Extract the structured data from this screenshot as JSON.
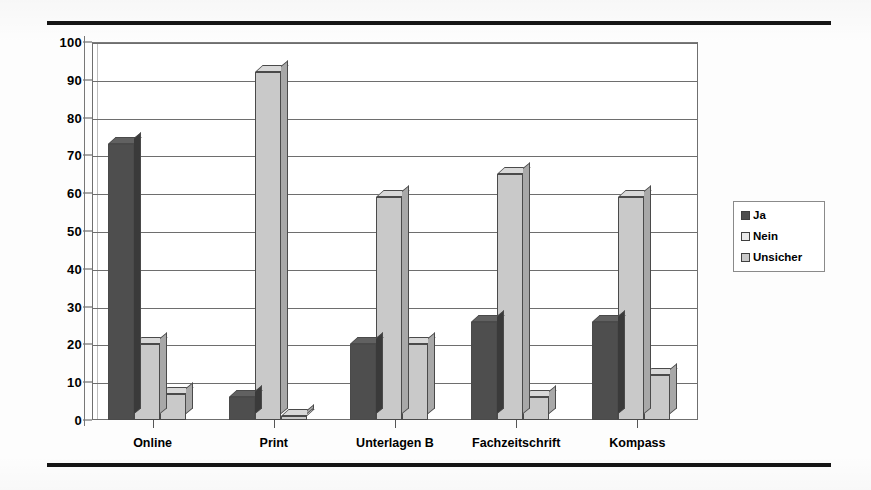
{
  "chart_data": {
    "type": "bar",
    "title": "",
    "xlabel": "",
    "ylabel": "",
    "ylim": [
      0,
      100
    ],
    "yticks": [
      0,
      10,
      20,
      30,
      40,
      50,
      60,
      70,
      80,
      90,
      100
    ],
    "grid": true,
    "legend_position": "right",
    "categories": [
      "Online",
      "Print",
      "Unterlagen B",
      "Fachzeitschrift",
      "Kompass"
    ],
    "series": [
      {
        "name": "Ja",
        "color": "#4e4e4e",
        "values": [
          73,
          6,
          20,
          26,
          26
        ]
      },
      {
        "name": "Nein",
        "color": "#c9c9c9",
        "values": [
          20,
          92,
          59,
          65,
          59
        ]
      },
      {
        "name": "Unsicher",
        "color": "#c9c9c9",
        "values": [
          7,
          1,
          20,
          6,
          12
        ]
      }
    ]
  },
  "axis": {
    "y_tick_labels": [
      "100",
      "90",
      "80",
      "70",
      "60",
      "50",
      "40",
      "30",
      "20",
      "10",
      "0"
    ],
    "x_tick_labels": [
      "Online",
      "Print",
      "Unterlagen B",
      "Fachzeitschrift",
      "Kompass"
    ]
  },
  "legend": {
    "items": [
      {
        "label": "Ja",
        "swatch": "dark-gray-swatch"
      },
      {
        "label": "Nein",
        "swatch": "white-swatch"
      },
      {
        "label": "Unsicher",
        "swatch": "light-gray-swatch"
      }
    ]
  },
  "decor": {
    "top_rule": "horizontal-rule",
    "bottom_rule": "horizontal-rule"
  }
}
